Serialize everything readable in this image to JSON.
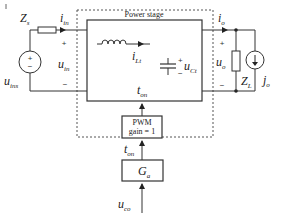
{
  "diagram": {
    "title": "Power stage",
    "pwm_block": {
      "line1": "PWM",
      "line2": "gain = 1"
    },
    "controller_block": {
      "label": "G",
      "sub": "a"
    },
    "input_side": {
      "source_voltage": {
        "label": "u",
        "sub": "ins"
      },
      "source_impedance": {
        "label": "Z",
        "sub": "s"
      },
      "input_current": {
        "label": "i",
        "sub": "in"
      },
      "input_voltage": {
        "label": "u",
        "sub": "in"
      },
      "plus": "+",
      "minus": "−"
    },
    "power_stage": {
      "inductor_current": {
        "label": "i",
        "sub": "Lt"
      },
      "capacitor_voltage": {
        "label": "u",
        "sub": "Ct"
      },
      "on_time": {
        "label": "t",
        "sub": "on"
      },
      "cap_plus": "+",
      "cap_minus": "−"
    },
    "output_side": {
      "output_current": {
        "label": "i",
        "sub": "o"
      },
      "output_voltage": {
        "label": "u",
        "sub": "o"
      },
      "load_impedance": {
        "label": "Z",
        "sub": "L"
      },
      "load_current_source": {
        "label": "j",
        "sub": "o"
      },
      "plus": "+",
      "minus": "−"
    },
    "control_path": {
      "on_time_signal": {
        "label": "t",
        "sub": "on"
      },
      "control_voltage": {
        "label": "u",
        "sub": "co"
      }
    },
    "colors": {
      "line": "#333333",
      "dashed": "#555555",
      "background": "#ffffff"
    }
  }
}
